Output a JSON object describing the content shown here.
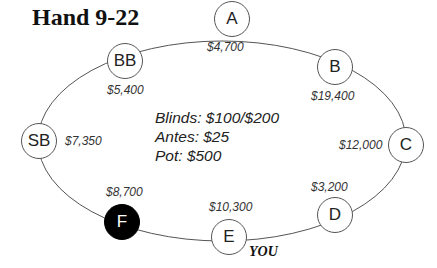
{
  "title": "Hand 9-22",
  "seats": [
    {
      "label": "A",
      "stack": "$4,700",
      "filled": false
    },
    {
      "label": "B",
      "stack": "$19,400",
      "filled": false
    },
    {
      "label": "C",
      "stack": "$12,000",
      "filled": false
    },
    {
      "label": "D",
      "stack": "$3,200",
      "filled": false
    },
    {
      "label": "E",
      "stack": "$10,300",
      "filled": false,
      "tag": "YOU"
    },
    {
      "label": "F",
      "stack": "$8,700",
      "filled": true
    },
    {
      "label": "SB",
      "stack": "$7,350",
      "filled": false
    },
    {
      "label": "BB",
      "stack": "$5,400",
      "filled": false
    }
  ],
  "info": {
    "blinds": "Blinds: $100/$200",
    "antes": "Antes: $25",
    "pot": "Pot: $500"
  },
  "colors": {
    "line": "#555555",
    "filled_seat": "#000000"
  }
}
